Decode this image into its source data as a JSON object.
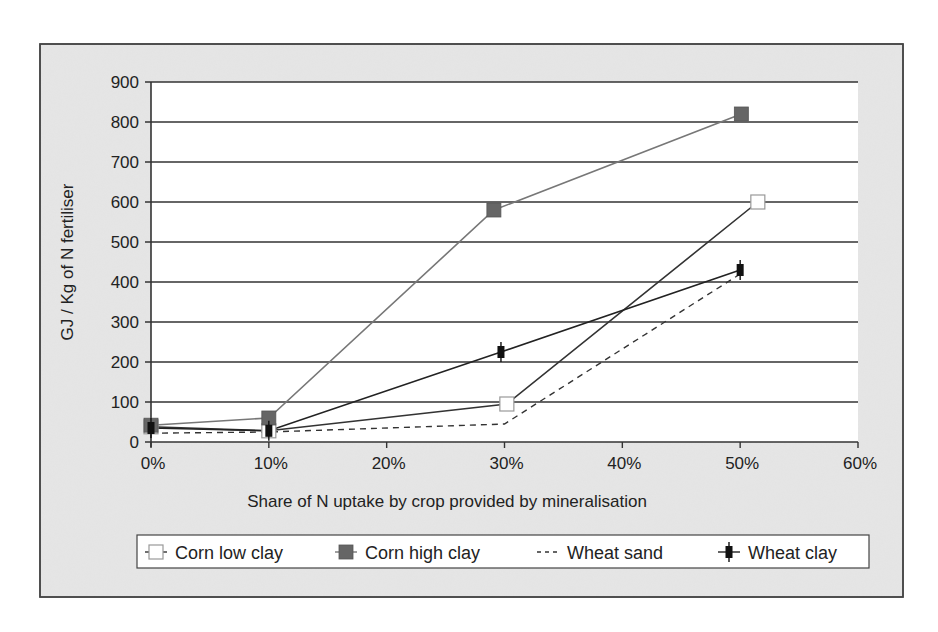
{
  "chart_data": {
    "type": "line",
    "title": "",
    "xlabel": "Share of N uptake by crop provided by mineralisation",
    "ylabel": "GJ / Kg of N fertiliser",
    "xlim": [
      0,
      60
    ],
    "ylim": [
      0,
      900
    ],
    "x_ticks": [
      "0%",
      "10%",
      "20%",
      "30%",
      "40%",
      "50%",
      "60%"
    ],
    "x_tick_values": [
      0,
      10,
      20,
      30,
      40,
      50,
      60
    ],
    "y_ticks": [
      "0",
      "100",
      "200",
      "300",
      "400",
      "500",
      "600",
      "700",
      "800",
      "900"
    ],
    "y_tick_values": [
      0,
      100,
      200,
      300,
      400,
      500,
      600,
      700,
      800,
      900
    ],
    "grid": "horizontal",
    "legend_position": "bottom",
    "series": [
      {
        "name": "Corn low clay",
        "marker": "open-square",
        "line": "solid",
        "color": "#333333",
        "fill": "#ffffff",
        "x": [
          0,
          10,
          30.2,
          51.5
        ],
        "values": [
          38,
          28,
          95,
          600
        ]
      },
      {
        "name": "Corn high clay",
        "marker": "filled-square",
        "line": "solid",
        "color": "#777777",
        "fill": "#666666",
        "x": [
          0,
          10,
          29.1,
          50.1
        ],
        "values": [
          42,
          60,
          580,
          820
        ]
      },
      {
        "name": "Wheat sand",
        "marker": "none",
        "line": "dashed",
        "color": "#333333",
        "fill": "none",
        "x": [
          0,
          10,
          30,
          50
        ],
        "values": [
          22,
          25,
          45,
          420
        ]
      },
      {
        "name": "Wheat clay",
        "marker": "filled-bar-with-whisker",
        "line": "solid",
        "color": "#222222",
        "fill": "#111111",
        "x": [
          0,
          10,
          29.7,
          50
        ],
        "values": [
          35,
          28,
          225,
          430
        ]
      }
    ]
  },
  "colors": {
    "frame_background": "#e6e6e6",
    "plot_background": "#ffffff",
    "grid_line": "#333333",
    "frame_border": "#444444"
  }
}
